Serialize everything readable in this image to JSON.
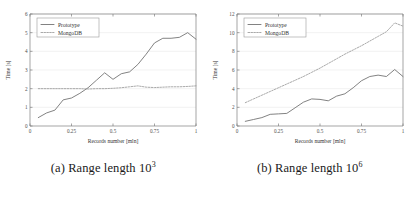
{
  "figure": {
    "subfigures": [
      {
        "caption_prefix": "(a)",
        "caption_text": "Range length 10",
        "caption_exponent": "3",
        "chart_data": {
          "type": "line",
          "title": "",
          "xlabel": "Records number [mln]",
          "ylabel": "Time [s]",
          "xlim": [
            0,
            1
          ],
          "ylim": [
            0,
            6
          ],
          "xticks": [
            0,
            0.25,
            0.5,
            0.75,
            1
          ],
          "xtick_labels": [
            "0",
            "0.25",
            "0.5",
            "0.75",
            "1"
          ],
          "yticks": [
            0,
            1,
            2,
            3,
            4,
            5,
            6
          ],
          "ytick_labels": [
            "0",
            "1",
            "2",
            "3",
            "4",
            "5",
            "6"
          ],
          "grid": true,
          "legend_position": "upper left",
          "series": [
            {
              "name": "Prototype",
              "style": "solid",
              "color": "#6b6b6b",
              "x": [
                0.05,
                0.1,
                0.15,
                0.2,
                0.25,
                0.3,
                0.35,
                0.4,
                0.45,
                0.5,
                0.55,
                0.6,
                0.65,
                0.7,
                0.75,
                0.8,
                0.85,
                0.9,
                0.95,
                1.0
              ],
              "values": [
                0.45,
                0.7,
                0.85,
                1.4,
                1.5,
                1.75,
                2.05,
                2.45,
                2.85,
                2.5,
                2.8,
                2.9,
                3.3,
                3.85,
                4.45,
                4.7,
                4.7,
                4.75,
                5.0,
                4.65
              ]
            },
            {
              "name": "MongoDB",
              "style": "dashed",
              "color": "#9a9a9a",
              "x": [
                0.05,
                0.1,
                0.15,
                0.2,
                0.25,
                0.3,
                0.35,
                0.4,
                0.45,
                0.5,
                0.55,
                0.6,
                0.65,
                0.7,
                0.75,
                0.8,
                0.85,
                0.9,
                0.95,
                1.0
              ],
              "values": [
                2.0,
                2.0,
                2.0,
                2.0,
                2.0,
                2.0,
                1.98,
                2.0,
                2.0,
                2.02,
                2.05,
                2.1,
                2.15,
                2.08,
                2.06,
                2.08,
                2.1,
                2.1,
                2.12,
                2.15
              ]
            }
          ]
        }
      },
      {
        "caption_prefix": "(b)",
        "caption_text": "Range length 10",
        "caption_exponent": "6",
        "chart_data": {
          "type": "line",
          "title": "",
          "xlabel": "Records number [mln]",
          "ylabel": "Time [s]",
          "xlim": [
            0,
            1
          ],
          "ylim": [
            0,
            12
          ],
          "xticks": [
            0,
            0.25,
            0.5,
            0.75,
            1
          ],
          "xtick_labels": [
            "0",
            "0.25",
            "0.5",
            "0.75",
            "1"
          ],
          "yticks": [
            0,
            2,
            4,
            6,
            8,
            10,
            12
          ],
          "ytick_labels": [
            "0",
            "2",
            "4",
            "6",
            "8",
            "10",
            "12"
          ],
          "grid": true,
          "legend_position": "upper left",
          "series": [
            {
              "name": "Prototype",
              "style": "solid",
              "color": "#6b6b6b",
              "x": [
                0.05,
                0.1,
                0.15,
                0.2,
                0.25,
                0.3,
                0.35,
                0.4,
                0.45,
                0.5,
                0.55,
                0.6,
                0.65,
                0.7,
                0.75,
                0.8,
                0.85,
                0.9,
                0.95,
                1.0
              ],
              "values": [
                0.5,
                0.7,
                0.9,
                1.25,
                1.3,
                1.35,
                1.95,
                2.55,
                2.9,
                2.85,
                2.7,
                3.2,
                3.45,
                4.1,
                4.85,
                5.3,
                5.45,
                5.3,
                6.05,
                5.3
              ]
            },
            {
              "name": "MongoDB",
              "style": "dashed",
              "color": "#9a9a9a",
              "x": [
                0.05,
                0.1,
                0.15,
                0.2,
                0.25,
                0.3,
                0.35,
                0.4,
                0.45,
                0.5,
                0.55,
                0.6,
                0.65,
                0.7,
                0.75,
                0.8,
                0.85,
                0.9,
                0.95,
                1.0
              ],
              "values": [
                2.5,
                2.9,
                3.3,
                3.7,
                4.1,
                4.5,
                4.9,
                5.3,
                5.75,
                6.2,
                6.7,
                7.2,
                7.7,
                8.15,
                8.6,
                9.1,
                9.6,
                10.1,
                11.05,
                10.7
              ]
            }
          ]
        }
      }
    ]
  }
}
